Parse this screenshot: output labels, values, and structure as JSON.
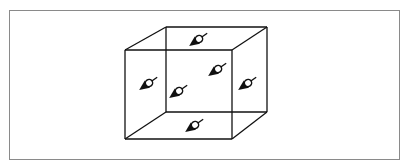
{
  "figure": {
    "type": "wireframe-cube-with-dipoles",
    "stroke_color": "#111111",
    "frame_color": "#8a8a8a",
    "background": "#ffffff",
    "cube": {
      "front_face": {
        "x1": 125,
        "y1": 50,
        "x2": 232,
        "y2": 139
      },
      "back_face": {
        "x1": 166,
        "y1": 27,
        "x2": 267,
        "y2": 112
      }
    },
    "dipoles": [
      {
        "position": "top-face",
        "cx": 199,
        "cy": 39
      },
      {
        "position": "back-face",
        "cx": 218,
        "cy": 69
      },
      {
        "position": "left-face",
        "cx": 149,
        "cy": 83
      },
      {
        "position": "center",
        "cx": 179,
        "cy": 91
      },
      {
        "position": "right-face",
        "cx": 248,
        "cy": 83
      },
      {
        "position": "bottom-face",
        "cx": 195,
        "cy": 125
      }
    ]
  }
}
